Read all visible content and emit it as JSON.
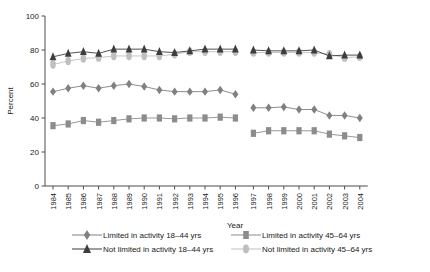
{
  "chart_data": {
    "type": "line",
    "title": "",
    "xlabel": "Year",
    "ylabel": "Percent",
    "ylim": [
      0,
      100
    ],
    "yticks": [
      0,
      20,
      40,
      60,
      80,
      100
    ],
    "grid": false,
    "legend_position": "bottom",
    "note": "Two panels separated by a break between 1996 and 1997 (survey redesign).",
    "categories": [
      "1984",
      "1985",
      "1986",
      "1987",
      "1988",
      "1989",
      "1990",
      "1991",
      "1992",
      "1993",
      "1994",
      "1995",
      "1996",
      "1997",
      "1998",
      "1999",
      "2000",
      "2001",
      "2002",
      "2003",
      "2004"
    ],
    "panels": [
      {
        "name": "1984-1996",
        "categories": [
          "1984",
          "1985",
          "1986",
          "1987",
          "1988",
          "1989",
          "1990",
          "1991",
          "1992",
          "1993",
          "1994",
          "1995",
          "1996"
        ]
      },
      {
        "name": "1997-2004",
        "categories": [
          "1997",
          "1998",
          "1999",
          "2000",
          "2001",
          "2002",
          "2003",
          "2004"
        ]
      }
    ],
    "series": [
      {
        "name": "Limited in activity 18–44 yrs",
        "marker": "diamond",
        "color": "#808080",
        "values_panel1": [
          55.5,
          57.5,
          59.0,
          57.5,
          59.0,
          60.0,
          58.5,
          56.5,
          55.5,
          55.5,
          55.5,
          56.5,
          54.0
        ],
        "values_panel2": [
          46.0,
          46.0,
          46.5,
          45.0,
          45.0,
          41.5,
          41.5,
          40.0
        ]
      },
      {
        "name": "Limited in activity 45–64 yrs",
        "marker": "square",
        "color": "#8c8c8c",
        "values_panel1": [
          35.5,
          36.5,
          38.5,
          37.5,
          38.5,
          39.5,
          40.0,
          40.0,
          39.5,
          40.0,
          40.0,
          40.5,
          40.0
        ],
        "values_panel2": [
          31.0,
          32.5,
          32.5,
          32.5,
          32.5,
          30.5,
          29.5,
          28.5
        ]
      },
      {
        "name": "Not limited in activity 18–44 yrs",
        "marker": "triangle",
        "color": "#3d3d3d",
        "values_panel1": [
          76.0,
          78.0,
          79.0,
          78.0,
          80.5,
          80.5,
          80.5,
          79.0,
          78.5,
          79.5,
          80.5,
          80.5,
          80.5
        ],
        "values_panel2": [
          80.0,
          79.5,
          79.5,
          79.5,
          80.0,
          76.5,
          77.0,
          77.0
        ]
      },
      {
        "name": "Not limited in activity 45–64 yrs",
        "marker": "circle",
        "color": "#bfbfbf",
        "values_panel1": [
          71.5,
          73.5,
          75.0,
          75.5,
          76.5,
          76.5,
          76.5,
          76.5,
          77.5,
          79.0,
          79.0,
          79.0,
          79.0
        ],
        "values_panel2": [
          78.5,
          78.5,
          78.5,
          78.5,
          78.5,
          77.5,
          75.5,
          76.0
        ]
      }
    ]
  },
  "axis": {
    "y_label": "Percent",
    "x_label": "Year",
    "y_ticks": [
      "0",
      "20",
      "40",
      "60",
      "80",
      "100"
    ]
  },
  "legend": {
    "items": [
      {
        "label": "Limited in activity 18–44 yrs",
        "marker": "diamond",
        "color": "#808080"
      },
      {
        "label": "Limited in activity 45–64 yrs",
        "marker": "square",
        "color": "#8c8c8c"
      },
      {
        "label": "Not limited in activity 18–44 yrs",
        "marker": "triangle",
        "color": "#3d3d3d"
      },
      {
        "label": "Not limited in activity 45–64 yrs",
        "marker": "circle",
        "color": "#bfbfbf"
      }
    ]
  }
}
